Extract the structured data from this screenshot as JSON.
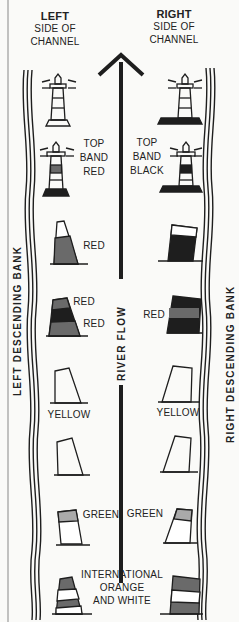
{
  "headers": {
    "left": {
      "title": "LEFT",
      "line1": "SIDE OF",
      "line2": "CHANNEL"
    },
    "right": {
      "title": "RIGHT",
      "line1": "SIDE OF",
      "line2": "CHANNEL"
    }
  },
  "center": {
    "river_flow_label": "RIVER FLOW"
  },
  "banks": {
    "left_label": "LEFT DESCENDING BANK",
    "right_label": "RIGHT DESCENDING BANK"
  },
  "markers": {
    "row2": {
      "left": [
        "TOP",
        "BAND",
        "RED"
      ],
      "right": [
        "TOP",
        "BAND",
        "BLACK"
      ]
    },
    "row3": {
      "left": "RED"
    },
    "row4": {
      "left_top": "RED",
      "left_bottom": "RED",
      "right": "RED"
    },
    "row5": {
      "left": "YELLOW",
      "right": "YELLOW"
    },
    "row7": {
      "left": "GREEN",
      "right": "GREEN"
    },
    "row8": {
      "line1": "INTERNATIONAL",
      "line2": "ORANGE",
      "line3": "AND WHITE"
    }
  },
  "colors": {
    "ink": "#1e1e1e",
    "gray_fill": "#6a6a6a",
    "paper": "#fafaf8"
  }
}
